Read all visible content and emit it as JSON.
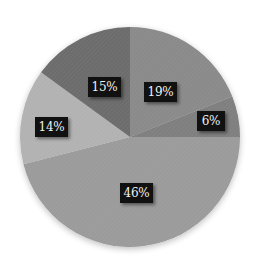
{
  "chart_data": {
    "type": "pie",
    "title": "",
    "start_angle": "12 o'clock",
    "direction": "clockwise",
    "legend": "none",
    "slices": [
      {
        "label": "19%",
        "value": 19,
        "color": "#8a8a8a"
      },
      {
        "label": "6%",
        "value": 6,
        "color": "#7f7f7f"
      },
      {
        "label": "46%",
        "value": 46,
        "color": "#9b9b9b"
      },
      {
        "label": "14%",
        "value": 14,
        "color": "#b2b2b2"
      },
      {
        "label": "15%",
        "value": 15,
        "color": "#6c6c6c"
      }
    ],
    "data_labels": [
      "19%",
      "6%",
      "46%",
      "14%",
      "15%"
    ]
  },
  "labels": {
    "s0": "19%",
    "s1": "6%",
    "s2": "46%",
    "s3": "14%",
    "s4": "15%"
  }
}
